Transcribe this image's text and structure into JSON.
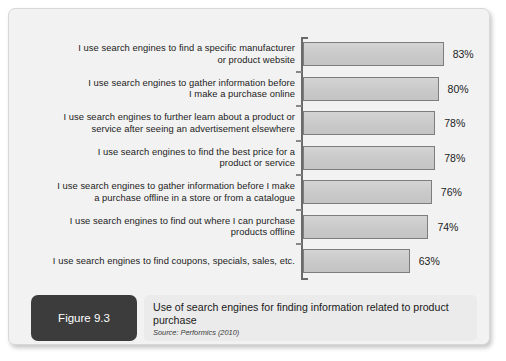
{
  "figure": {
    "badge_label": "Figure 9.3",
    "title": "Use of search engines for finding information related to product purchase",
    "source": "Source: Performics (2010)"
  },
  "colors": {
    "panel_background": "#f2f2f2",
    "bar_fill": "#cbcbcb",
    "bar_border": "#7d7d7d",
    "axis": "#6a6a6a",
    "badge_background": "#3c3c3c",
    "caption_background": "#ebebeb",
    "text": "#1c1c1c"
  },
  "chart_data": {
    "type": "bar",
    "orientation": "horizontal",
    "title": "Use of search engines for finding information related to product purchase",
    "subtitle": "Source: Performics (2010)",
    "xlabel": "",
    "ylabel": "",
    "xlim": [
      0,
      100
    ],
    "grid": false,
    "legend": false,
    "value_suffix": "%",
    "categories": [
      "I use search engines to find a specific manufacturer or product website",
      "I use search engines to gather information before I make a purchase online",
      "I use search engines to further learn about a product or service after seeing an advertisement elsewhere",
      "I use search engines to find the best price for a product or service",
      "I use search engines to gather information before I make a purchase offline in a store or from a catalogue",
      "I use search engines to find out where I can purchase products offline",
      "I use search engines to find coupons, specials, sales, etc."
    ],
    "values": [
      83,
      80,
      78,
      78,
      76,
      74,
      63
    ],
    "data_labels": [
      "83%",
      "80%",
      "78%",
      "78%",
      "76%",
      "74%",
      "63%"
    ],
    "category_lines": [
      [
        "I use search engines to find a specific manufacturer",
        "or product website"
      ],
      [
        "I use search engines to gather information before",
        "I make a purchase online"
      ],
      [
        "I use search engines to further learn about a product or",
        "service after seeing an advertisement elsewhere"
      ],
      [
        "I use search engines to find the best price for a",
        "product or service"
      ],
      [
        "I use search engines to gather information before I make",
        "a purchase offline in a store or from a catalogue"
      ],
      [
        "I use search engines to find out where I can purchase",
        "products offline"
      ],
      [
        "I use search engines to find coupons, specials, sales, etc."
      ]
    ]
  }
}
